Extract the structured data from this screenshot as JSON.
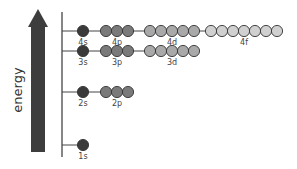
{
  "diagram": {
    "axis_label": "energy",
    "colors": {
      "s": "#3a3a3a",
      "p": "#7a7a7a",
      "d": "#a9a9a9",
      "f": "#d0d0d0",
      "line": "#444444",
      "arrow": "#3d3d3d"
    },
    "levels": [
      {
        "y": 31,
        "orbitals": [
          {
            "label": "4s",
            "type": "s",
            "count": 1
          },
          {
            "label": "4p",
            "type": "p",
            "count": 3
          },
          {
            "label": "4d",
            "type": "d",
            "count": 5
          },
          {
            "label": "4f",
            "type": "f",
            "count": 7
          }
        ]
      },
      {
        "y": 51,
        "orbitals": [
          {
            "label": "3s",
            "type": "s",
            "count": 1
          },
          {
            "label": "3p",
            "type": "p",
            "count": 3
          },
          {
            "label": "3d",
            "type": "d",
            "count": 5
          }
        ]
      },
      {
        "y": 92,
        "orbitals": [
          {
            "label": "2s",
            "type": "s",
            "count": 1
          },
          {
            "label": "2p",
            "type": "p",
            "count": 3
          }
        ]
      },
      {
        "y": 145,
        "orbitals": [
          {
            "label": "1s",
            "type": "s",
            "count": 1
          }
        ]
      }
    ]
  }
}
